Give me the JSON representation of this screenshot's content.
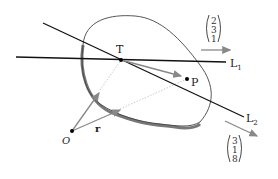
{
  "diagram": {
    "labels": {
      "T": "T",
      "P": "P",
      "O": "O",
      "r": "r",
      "L1": "L",
      "L1_sub": "1",
      "L2": "L",
      "L2_sub": "2"
    },
    "vectors": {
      "top": [
        "2",
        "3",
        "1"
      ],
      "bottom": [
        "3",
        "1",
        "8"
      ]
    },
    "colors": {
      "line": "#111111",
      "arrow": "#888888",
      "dotted": "#bbbbbb",
      "surface_shadow": "#777777"
    }
  }
}
